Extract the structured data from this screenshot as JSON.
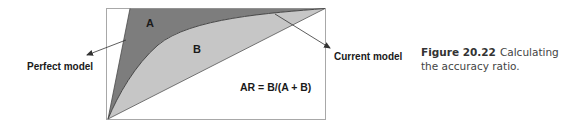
{
  "diagram": {
    "region_a_label": "A",
    "region_b_label": "B",
    "formula": "AR = B/(A + B)",
    "perfect_model_label": "Perfect model",
    "current_model_label": "Current model",
    "colors": {
      "region_a": "#7d7d7d",
      "region_b": "#c6c6c6",
      "frame": "#a8a8a8",
      "line": "#4a4a4a",
      "text": "#1a1a1a"
    }
  },
  "caption": {
    "figure_number": "Figure 20.22",
    "text": "Calculating the accuracy ratio."
  }
}
